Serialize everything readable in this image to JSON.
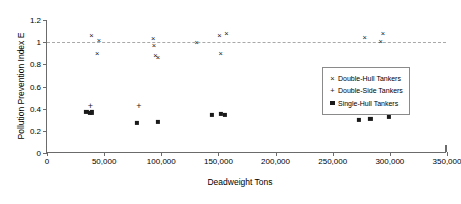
{
  "chart_data": {
    "type": "scatter",
    "title": "",
    "xlabel": "Deadweight Tons",
    "ylabel": "Pollution Prevention Index E",
    "xlim": [
      0,
      350000
    ],
    "ylim": [
      0,
      1.2
    ],
    "xticks": [
      0,
      50000,
      100000,
      150000,
      200000,
      250000,
      300000,
      350000
    ],
    "xticklabels": [
      "0",
      "50,000",
      "100,000",
      "150,000",
      "200,000",
      "250,000",
      "300,000",
      "350,000"
    ],
    "yticks": [
      0,
      0.2,
      0.4,
      0.6,
      0.8,
      1,
      1.2
    ],
    "yticklabels": [
      "0",
      "0.2",
      "0.4",
      "0.6",
      "0.8",
      "1",
      "1.2"
    ],
    "grid": false,
    "legend_position": "center-right",
    "reference_line": {
      "y": 1.0,
      "style": "dashed",
      "color": "#a9a9a9"
    },
    "series": [
      {
        "name": "Double-Hull Tankers",
        "marker": "x",
        "color": "#1a1a1a",
        "points": [
          [
            39000,
            1.055
          ],
          [
            45500,
            1.012
          ],
          [
            44000,
            0.893
          ],
          [
            93000,
            1.032
          ],
          [
            93500,
            0.967
          ],
          [
            95000,
            0.873
          ],
          [
            97000,
            0.855
          ],
          [
            131000,
            0.988
          ],
          [
            151000,
            1.055
          ],
          [
            157000,
            1.078
          ],
          [
            152000,
            0.893
          ],
          [
            278000,
            1.034
          ],
          [
            294000,
            1.077
          ],
          [
            292000,
            0.998
          ]
        ]
      },
      {
        "name": "Double-Side Tankers",
        "marker": "+",
        "color": "#1a1a1a",
        "points": [
          [
            38000,
            0.423
          ],
          [
            80500,
            0.423
          ]
        ]
      },
      {
        "name": "Single-Hull Tankers",
        "marker": "square",
        "color": "#1a1a1a",
        "points": [
          [
            34500,
            0.372
          ],
          [
            37500,
            0.361
          ],
          [
            39500,
            0.367
          ],
          [
            79000,
            0.268
          ],
          [
            97000,
            0.281
          ],
          [
            144000,
            0.341
          ],
          [
            152500,
            0.352
          ],
          [
            155500,
            0.347
          ],
          [
            273000,
            0.3
          ],
          [
            283000,
            0.307
          ],
          [
            299000,
            0.331
          ]
        ]
      }
    ]
  },
  "legend": {
    "items": [
      {
        "marker": "×",
        "label": "Double-Hull Tankers"
      },
      {
        "marker": "+",
        "label": "Double-Side Tankers"
      },
      {
        "marker": "square",
        "label": "Single-Hull Tankers"
      }
    ]
  }
}
